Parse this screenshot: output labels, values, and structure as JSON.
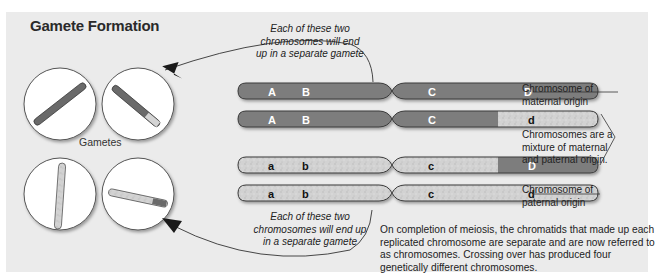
{
  "title": "Gamete Formation",
  "gametes_label": "Gametes",
  "top_note": [
    "Each of these two",
    "chromosomes will end",
    "up in a separate gamete"
  ],
  "bottom_note": [
    "Each of these two",
    "chromosomes will end up",
    "in a separate gamete"
  ],
  "labels": {
    "maternal": [
      "Chromosome of",
      "maternal origin"
    ],
    "mixture": [
      "Chromosomes are a",
      "mixture of maternal",
      "and paternal origin."
    ],
    "paternal": [
      "Chromosome of",
      "paternal origin"
    ]
  },
  "caption": "On completion of meiosis, the chromatids that made up each replicated chromosome are separate and are now referred to as chromosomes. Crossing over has produced four genetically different chromosomes.",
  "chromosomes": [
    {
      "id": "maternal",
      "genes": [
        "A",
        "B",
        "C",
        "D"
      ]
    },
    {
      "id": "recombinant-1",
      "genes": [
        "A",
        "B",
        "C",
        "d"
      ]
    },
    {
      "id": "recombinant-2",
      "genes": [
        "a",
        "b",
        "c",
        "D"
      ]
    },
    {
      "id": "paternal",
      "genes": [
        "a",
        "b",
        "c",
        "d"
      ]
    }
  ],
  "colors": {
    "panel": "#ebebeb",
    "maternal": "#7d7d7d",
    "paternal": "#cfcfcf",
    "outline": "#3a3a3a"
  }
}
